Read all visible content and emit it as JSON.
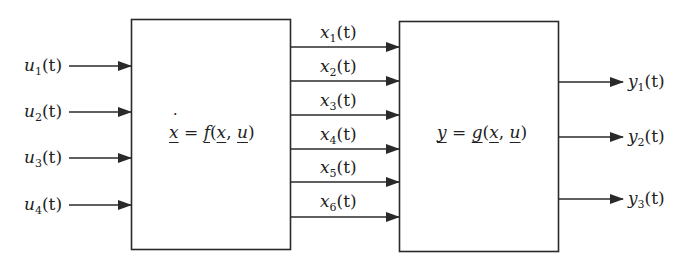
{
  "diagram": {
    "type": "block-diagram",
    "inputs": [
      {
        "var": "u",
        "sub": "1",
        "arg": "(t)"
      },
      {
        "var": "u",
        "sub": "2",
        "arg": "(t)"
      },
      {
        "var": "u",
        "sub": "3",
        "arg": "(t)"
      },
      {
        "var": "u",
        "sub": "4",
        "arg": "(t)"
      }
    ],
    "state_block": {
      "lhs": "x",
      "eq": " = ",
      "func": "f",
      "open": "(",
      "arg1": "x",
      "sep": ", ",
      "arg2": "u",
      "close": ")"
    },
    "states": [
      {
        "var": "x",
        "sub": "1",
        "arg": "(t)"
      },
      {
        "var": "x",
        "sub": "2",
        "arg": "(t)"
      },
      {
        "var": "x",
        "sub": "3",
        "arg": "(t)"
      },
      {
        "var": "x",
        "sub": "4",
        "arg": "(t)"
      },
      {
        "var": "x",
        "sub": "5",
        "arg": "(t)"
      },
      {
        "var": "x",
        "sub": "6",
        "arg": "(t)"
      }
    ],
    "output_block": {
      "lhs": "y",
      "eq": " = ",
      "func": "g",
      "open": "(",
      "arg1": "x",
      "sep": ", ",
      "arg2": "u",
      "close": ")"
    },
    "outputs": [
      {
        "var": "y",
        "sub": "1",
        "arg": "(t)"
      },
      {
        "var": "y",
        "sub": "2",
        "arg": "(t)"
      },
      {
        "var": "y",
        "sub": "3",
        "arg": "(t)"
      }
    ],
    "colors": {
      "line": "#2a2a2a",
      "background": "#ffffff"
    }
  }
}
